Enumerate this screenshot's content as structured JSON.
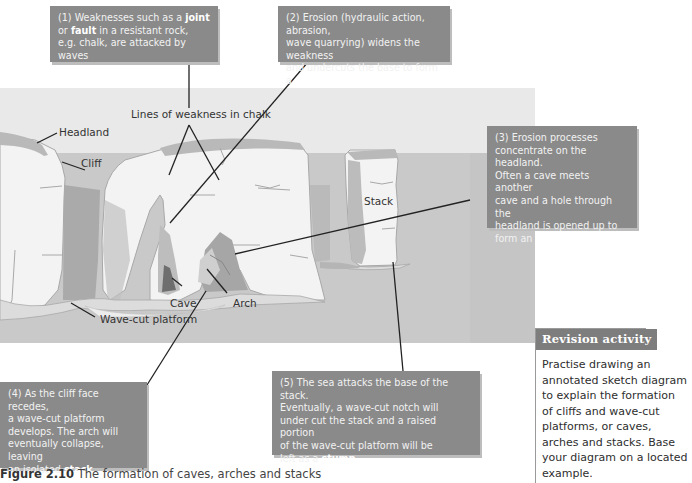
{
  "callouts": [
    {
      "id": 1,
      "lines": [
        [
          {
            "t": "(1) Weaknesses such as a "
          },
          {
            "t": "joint",
            "bold": true
          }
        ],
        [
          {
            "t": "or "
          },
          {
            "t": "fault",
            "bold": true
          },
          {
            "t": " in a resistant rock,"
          }
        ],
        [
          {
            "t": "e.g. chalk, are attacked by waves"
          }
        ]
      ]
    },
    {
      "id": 2,
      "lines": [
        [
          {
            "t": "(2) Erosion (hydraulic action, abrasion,"
          }
        ],
        [
          {
            "t": "wave quarrying) widens the weakness"
          }
        ],
        [
          {
            "t": "and undercuts the base to form a "
          },
          {
            "t": "cave",
            "bold": true
          }
        ]
      ]
    },
    {
      "id": 3,
      "lines": [
        [
          {
            "t": "(3) Erosion processes"
          }
        ],
        [
          {
            "t": "concentrate on the headland."
          }
        ],
        [
          {
            "t": "Often a cave meets another"
          }
        ],
        [
          {
            "t": "cave and a hole through the"
          }
        ],
        [
          {
            "t": "headland is opened up to"
          }
        ],
        [
          {
            "t": "form an "
          },
          {
            "t": "arch",
            "bold": true
          }
        ]
      ]
    },
    {
      "id": 4,
      "lines": [
        [
          {
            "t": "(4) As the cliff face recedes,"
          }
        ],
        [
          {
            "t": "a wave-cut platform"
          }
        ],
        [
          {
            "t": "develops. The arch will"
          }
        ],
        [
          {
            "t": "eventually collapse, leaving"
          }
        ],
        [
          {
            "t": "an isolated "
          },
          {
            "t": "stack",
            "bold": true
          }
        ]
      ]
    },
    {
      "id": 5,
      "lines": [
        [
          {
            "t": "(5) The sea attacks the base of the stack."
          }
        ],
        [
          {
            "t": "Eventually, a wave-cut notch will"
          }
        ],
        [
          {
            "t": "under cut the stack and a raised portion"
          }
        ],
        [
          {
            "t": "of the wave-cut platform will be"
          }
        ],
        [
          {
            "t": "left as a "
          },
          {
            "t": "stump",
            "bold": true
          }
        ]
      ]
    }
  ],
  "labels": {
    "lines_of_weakness": "Lines of weakness in chalk",
    "headland": "Headland",
    "cliff": "Cliff",
    "stack": "Stack",
    "cave": "Cave",
    "arch": "Arch",
    "wave_cut_platform": "Wave-cut platform"
  },
  "revision": {
    "title": "Revision activity",
    "body_lines": [
      "Practise drawing an",
      "annotated sketch diagram",
      "to explain the formation",
      "of cliffs and wave-cut",
      "platforms, or caves,",
      "arches and stacks. Base",
      "your diagram on a located",
      "example."
    ]
  },
  "caption": {
    "figure": "Figure 2.10",
    "text": " The formation of caves, arches and stacks"
  },
  "colors": {
    "callout_bg": "#8a8a8a",
    "callout_text": "#f2f2f2",
    "sea": "#c9c9c9",
    "sky": "#e9e9e9",
    "chalk": "#f3f3f3",
    "chalk_outline": "#a8a8a8",
    "turf": "#b9b9b9",
    "shadow": "#9c9c9c",
    "leader_line": "#222222",
    "revision_header": "#7d7d7d"
  }
}
